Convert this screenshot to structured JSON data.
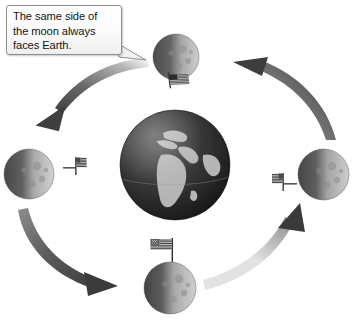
{
  "figure": {
    "background_color": "#ffffff"
  },
  "callout": {
    "text": "The same side of\nthe moon always\nfaces Earth.",
    "border_color": "#8e8e8e",
    "fill_color": "#ffffff",
    "text_color": "#141414"
  },
  "earth": {
    "label": "earth-globe",
    "ocean_color": "#2b2b2b",
    "land_color": "#c9c9c9"
  },
  "moons": [
    {
      "position": "top",
      "label": "moon-top",
      "lit_side": "right",
      "dark_color": "#4c4c4c",
      "lit_color": "#c4c4c4"
    },
    {
      "position": "left",
      "label": "moon-left",
      "lit_side": "right",
      "dark_color": "#4c4c4c",
      "lit_color": "#c4c4c4"
    },
    {
      "position": "right",
      "label": "moon-right",
      "lit_side": "right",
      "dark_color": "#4c4c4c",
      "lit_color": "#c4c4c4"
    },
    {
      "position": "bottom",
      "label": "moon-bottom",
      "lit_side": "right",
      "dark_color": "#4c4c4c",
      "lit_color": "#c4c4c4"
    }
  ],
  "flags": [
    {
      "position": "top",
      "label": "flag-top",
      "faces": "down-tilted"
    },
    {
      "position": "left",
      "label": "flag-left",
      "faces": "right"
    },
    {
      "position": "right",
      "label": "flag-right",
      "faces": "left"
    },
    {
      "position": "bottom",
      "label": "flag-bottom",
      "faces": "right"
    }
  ],
  "orbit": {
    "direction": "counterclockwise",
    "arrow_color": "#5a5a5a",
    "arrow_count": 4
  }
}
